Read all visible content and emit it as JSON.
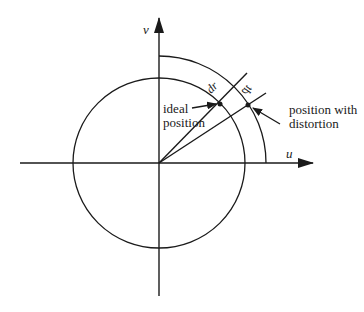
{
  "diagram": {
    "type": "radial-tangential-distortion",
    "axes": {
      "horizontal_label": "u",
      "vertical_label": "v"
    },
    "labels": {
      "radial_increment": "dr",
      "tangential_increment": "dt",
      "ideal_line1": "ideal",
      "ideal_line2": "position",
      "distorted_line1": "position with",
      "distorted_line2": "distortion"
    },
    "colors": {
      "stroke": "#1a1a1a",
      "background": "#ffffff"
    }
  }
}
